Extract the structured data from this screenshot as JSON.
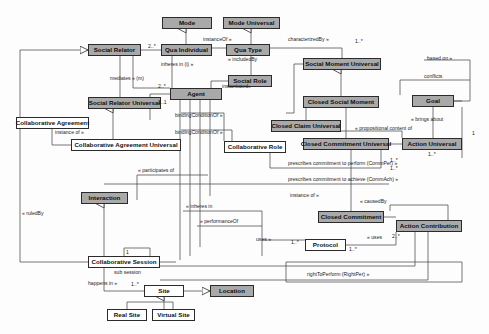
{
  "diagram": {
    "colors": {
      "shaded_fill": "#a9a9a9",
      "plain_fill": "#ffffff",
      "stroke": "#2b2b2b",
      "background": "#fdfdfd"
    },
    "nodes": [
      {
        "id": "mode",
        "label": "Mode",
        "style": "shaded",
        "x": 162,
        "y": 17,
        "w": 50,
        "h": 12
      },
      {
        "id": "mode-universal",
        "label": "Mode Universal",
        "style": "shaded",
        "x": 223,
        "y": 17,
        "w": 57,
        "h": 12
      },
      {
        "id": "social-relator",
        "label": "Social Relator",
        "style": "shaded",
        "x": 88,
        "y": 44,
        "w": 53,
        "h": 12
      },
      {
        "id": "qua-individual",
        "label": "Qua Individual",
        "style": "shaded",
        "x": 161,
        "y": 44,
        "w": 51,
        "h": 12
      },
      {
        "id": "qua-type",
        "label": "Qua Type",
        "style": "shaded",
        "x": 226,
        "y": 44,
        "w": 44,
        "h": 12
      },
      {
        "id": "social-moment-universal",
        "label": "Social Moment Universal",
        "style": "shaded",
        "x": 303,
        "y": 58,
        "w": 78,
        "h": 12
      },
      {
        "id": "social-role",
        "label": "Social Role",
        "style": "shaded",
        "x": 228,
        "y": 75,
        "w": 44,
        "h": 12
      },
      {
        "id": "agent",
        "label": "Agent",
        "style": "shaded",
        "x": 170,
        "y": 88,
        "w": 52,
        "h": 12
      },
      {
        "id": "goal",
        "label": "Goal",
        "style": "shaded",
        "x": 412,
        "y": 95,
        "w": 42,
        "h": 12
      },
      {
        "id": "closed-social-moment",
        "label": "Closed Social Moment",
        "style": "shaded",
        "x": 303,
        "y": 96,
        "w": 76,
        "h": 12
      },
      {
        "id": "social-relator-universal",
        "label": "Social Relator Universal",
        "style": "shaded",
        "x": 88,
        "y": 97,
        "w": 73,
        "h": 12
      },
      {
        "id": "collaborative-agreement",
        "label": "Collaborative Agreement",
        "style": "plain",
        "x": 16,
        "y": 117,
        "w": 73,
        "h": 12
      },
      {
        "id": "closed-claim-universal",
        "label": "Closed Claim Universal",
        "style": "shaded",
        "x": 271,
        "y": 120,
        "w": 70,
        "h": 12
      },
      {
        "id": "closed-commitment-universal",
        "label": "Closed Commitment Universal",
        "style": "shaded",
        "x": 303,
        "y": 138,
        "w": 86,
        "h": 12
      },
      {
        "id": "action-universal",
        "label": "Action Universal",
        "style": "shaded",
        "x": 402,
        "y": 138,
        "w": 60,
        "h": 12
      },
      {
        "id": "collaborative-agreement-universal",
        "label": "Collaborative Agreement Universal",
        "style": "plain",
        "x": 71,
        "y": 139,
        "w": 110,
        "h": 12
      },
      {
        "id": "collaborative-role",
        "label": "Collaborative Role",
        "style": "plain",
        "x": 224,
        "y": 141,
        "w": 62,
        "h": 12
      },
      {
        "id": "interaction",
        "label": "Interaction",
        "style": "shaded",
        "x": 81,
        "y": 192,
        "w": 47,
        "h": 12
      },
      {
        "id": "closed-commitment",
        "label": "Closed Commitment",
        "style": "shaded",
        "x": 318,
        "y": 211,
        "w": 66,
        "h": 12
      },
      {
        "id": "action-contribution",
        "label": "Action Contribution",
        "style": "shaded",
        "x": 396,
        "y": 220,
        "w": 66,
        "h": 12
      },
      {
        "id": "protocol",
        "label": "Protocol",
        "style": "plain",
        "x": 305,
        "y": 239,
        "w": 41,
        "h": 12
      },
      {
        "id": "collaborative-session",
        "label": "Collaborative Session",
        "style": "plain",
        "x": 88,
        "y": 256,
        "w": 72,
        "h": 12
      },
      {
        "id": "site",
        "label": "Site",
        "style": "plain",
        "x": 144,
        "y": 285,
        "w": 40,
        "h": 12
      },
      {
        "id": "location",
        "label": "Location",
        "style": "shaded",
        "x": 210,
        "y": 285,
        "w": 44,
        "h": 12
      },
      {
        "id": "real-site",
        "label": "Real Site",
        "style": "plain",
        "x": 107,
        "y": 309,
        "w": 40,
        "h": 12
      },
      {
        "id": "virtual-site",
        "label": "Virtual Site",
        "style": "plain",
        "x": 152,
        "y": 309,
        "w": 43,
        "h": 12
      }
    ],
    "edge_labels": [
      {
        "id": "instanceof-qua",
        "text": "instanceOf »",
        "x": 203,
        "y": 37
      },
      {
        "id": "characterizedby",
        "text": "characterizedBy »",
        "x": 288,
        "y": 37
      },
      {
        "id": "includedby",
        "text": "« includedBy",
        "x": 228,
        "y": 57
      },
      {
        "id": "inheres-in-i",
        "text": "inheres in (i) »",
        "x": 161,
        "y": 62
      },
      {
        "id": "mediates-m",
        "text": "mediates » (m)",
        "x": 110,
        "y": 76
      },
      {
        "id": "instantiated",
        "text": "instantiated»",
        "x": 222,
        "y": 84
      },
      {
        "id": "based-on",
        "text": "based on »",
        "x": 427,
        "y": 56
      },
      {
        "id": "conflicts",
        "text": "conflicts",
        "x": 424,
        "y": 74
      },
      {
        "id": "bindingconditionof-1",
        "text": "bindingConditionOf »",
        "x": 175,
        "y": 113
      },
      {
        "id": "bindingconditionof-2",
        "text": "bindingConditionOf »",
        "x": 175,
        "y": 130
      },
      {
        "id": "instance-of-1",
        "text": "instance of »",
        "x": 55,
        "y": 130
      },
      {
        "id": "brings-about",
        "text": "« brings about",
        "x": 411,
        "y": 117
      },
      {
        "id": "propositional-content",
        "text": "« propositional content of",
        "x": 355,
        "y": 126
      },
      {
        "id": "prescribes-commper",
        "text": "prescribes commitment to perform (CommPer) »",
        "x": 288,
        "y": 161
      },
      {
        "id": "prescribes-commach",
        "text": "prescribes commitment to achieve (CommAch) »",
        "x": 288,
        "y": 177
      },
      {
        "id": "participates-of",
        "text": "« participates of",
        "x": 138,
        "y": 168
      },
      {
        "id": "ruledby",
        "text": "« ruledBy",
        "x": 22,
        "y": 211
      },
      {
        "id": "inheres-in-2",
        "text": "« inheres in",
        "x": 186,
        "y": 204
      },
      {
        "id": "instance-of-2",
        "text": "instance of »",
        "x": 290,
        "y": 193
      },
      {
        "id": "causedby",
        "text": "« causedBy",
        "x": 360,
        "y": 199
      },
      {
        "id": "performanceof",
        "text": "« performanceOf",
        "x": 200,
        "y": 219
      },
      {
        "id": "uses-1",
        "text": "uses »",
        "x": 256,
        "y": 237
      },
      {
        "id": "uses-2",
        "text": "« uses",
        "x": 367,
        "y": 235
      },
      {
        "id": "sub-session",
        "text": "sub session",
        "x": 114,
        "y": 270
      },
      {
        "id": "happens-in",
        "text": "happens in »",
        "x": 88,
        "y": 281
      },
      {
        "id": "righttoperform",
        "text": "rightToPerform (RightPer) »",
        "x": 307,
        "y": 272
      }
    ],
    "multiplicities": [
      {
        "id": "m-qua-left",
        "text": "2..*",
        "x": 148,
        "y": 44
      },
      {
        "id": "m-smu-right",
        "text": "1..*",
        "x": 355,
        "y": 39
      },
      {
        "id": "m-agent-top",
        "text": "2..*",
        "x": 158,
        "y": 84
      },
      {
        "id": "m-agent-bot",
        "text": "2..1",
        "x": 158,
        "y": 100
      },
      {
        "id": "m-au-right",
        "text": "1",
        "x": 472,
        "y": 131
      },
      {
        "id": "m-au-left",
        "text": "1..*",
        "x": 428,
        "y": 152
      },
      {
        "id": "m-ccu-right",
        "text": "1..*",
        "x": 390,
        "y": 158
      },
      {
        "id": "m-ccu-right2",
        "text": "1..*",
        "x": 390,
        "y": 166
      },
      {
        "id": "m-ac-left",
        "text": "2..*",
        "x": 392,
        "y": 234
      },
      {
        "id": "m-proto-left",
        "text": "1..*",
        "x": 291,
        "y": 240
      },
      {
        "id": "m-proto-right",
        "text": "1..*",
        "x": 349,
        "y": 247
      },
      {
        "id": "m-sess-top",
        "text": "1",
        "x": 126,
        "y": 250
      },
      {
        "id": "m-site-left",
        "text": "1..*",
        "x": 131,
        "y": 282
      }
    ]
  }
}
